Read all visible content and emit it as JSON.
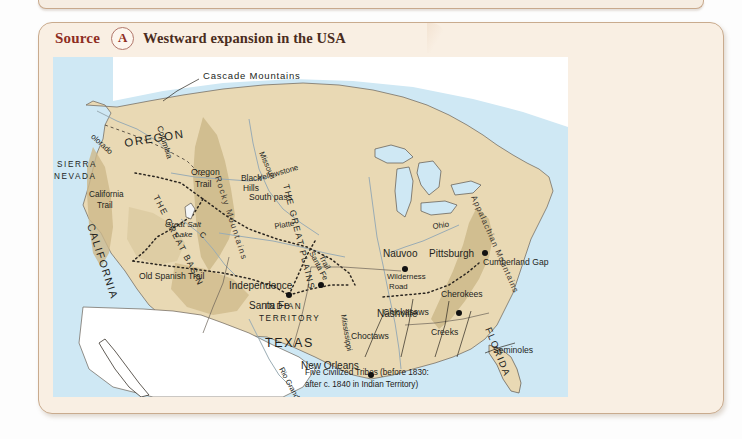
{
  "card": {
    "source_word": "Source",
    "source_letter": "A",
    "title": "Westward expansion in the USA"
  },
  "map": {
    "key_line1": "Five Civilized Tribes (before 1830:",
    "key_line2": "after c. 1840 in Indian Territory)",
    "cities": [
      {
        "name": "Nauvoo",
        "x": 352,
        "y": 212
      },
      {
        "name": "Pittsburgh",
        "x": 432,
        "y": 196
      },
      {
        "name": "Independence",
        "x": 305,
        "y": 237
      },
      {
        "name": "Nashville",
        "x": 383,
        "y": 256
      },
      {
        "name": "Santa Fe",
        "x": 232,
        "y": 268
      },
      {
        "name": "New Orleans",
        "x": 342,
        "y": 325
      }
    ],
    "regions": [
      {
        "name": "OREGON"
      },
      {
        "name": "CALIFORNIA"
      },
      {
        "name": "SIERRA NEVADA"
      },
      {
        "name": "TEXAS"
      },
      {
        "name": "FLORIDA"
      },
      {
        "name": "INDIAN TERRITORY"
      },
      {
        "name": "THE GREAT BASIN"
      },
      {
        "name": "THE GREAT PLAINS"
      }
    ],
    "physical": [
      {
        "name": "Cascade Mountains"
      },
      {
        "name": "Rocky Mountains"
      },
      {
        "name": "Appalachian Mountains"
      },
      {
        "name": "Black Hills"
      },
      {
        "name": "Great Salt Lake"
      },
      {
        "name": "South pass"
      },
      {
        "name": "Cumberland Gap"
      },
      {
        "name": "Columbia"
      },
      {
        "name": "Yellowstone"
      },
      {
        "name": "Missouri"
      },
      {
        "name": "Platte"
      },
      {
        "name": "Colorado"
      },
      {
        "name": "Ohio"
      },
      {
        "name": "Mississippi"
      },
      {
        "name": "Rio Grande"
      }
    ],
    "trails": [
      {
        "name": "Oregon Trail"
      },
      {
        "name": "California Trail"
      },
      {
        "name": "Old Spanish Trail"
      },
      {
        "name": "Santa Fe Trail"
      },
      {
        "name": "Wilderness Road"
      }
    ],
    "tribes": [
      {
        "name": "Cherokees"
      },
      {
        "name": "Chickasaws"
      },
      {
        "name": "Choctaws"
      },
      {
        "name": "Creeks"
      },
      {
        "name": "Seminoles"
      }
    ],
    "labels": {
      "cascade_mountains": "Cascade Mountains",
      "columbia": "Columbia",
      "oregon": "OREGON",
      "oregon_trail_1": "Oregon",
      "oregon_trail_2": "Trail",
      "rocky_mountains": "Rocky Mountains",
      "yellowstone": "Yellowstone",
      "missouri": "Missouri",
      "black_hills_1": "Black",
      "black_hills_2": "Hills",
      "sierra_1": "SIERRA",
      "sierra_2": "NEVADA",
      "california_trail_1": "California",
      "california_trail_2": "Trail",
      "great_basin": "THE GREAT BASIN",
      "great_salt_lake_1": "Great Salt",
      "great_salt_lake_2": "Lake",
      "south_pass": "South pass",
      "great_plains": "THE GREAT PLAINS",
      "platte": "Platte",
      "colorado": "Colorado",
      "california": "CALIFORNIA",
      "old_spanish_trail": "Old Spanish Trail",
      "santa_fe_trail_1": "Santa Fe",
      "santa_fe_trail_2": "Trail",
      "santa_fe": "Santa Fe",
      "nauvoo": "Nauvoo",
      "independence": "Independence",
      "pittsburgh": "Pittsburgh",
      "ohio": "Ohio",
      "appalachian": "Appalachian Mountains",
      "wilderness_road_1": "Wilderness",
      "wilderness_road_2": "Road",
      "cumberland_gap": "Cumberland Gap",
      "nashville": "Nashville",
      "cherokees": "Cherokees",
      "chickasaws": "Chickasaws",
      "choctaws": "Choctaws",
      "creeks": "Creeks",
      "seminoles": "Seminoles",
      "florida": "FLORIDA",
      "mississippi": "Mississippi",
      "indian_territory_1": "INDIAN",
      "indian_territory_2": "TERRITORY",
      "texas": "TEXAS",
      "new_orleans": "New Orleans",
      "rio_grande": "Rio Grande"
    },
    "colors": {
      "ocean": "#cfe8f4",
      "land": "#e9d9b4",
      "highland": "#cdb88a",
      "foreign": "#ffffff",
      "trail": "#2b2620",
      "river": "#9aacb4"
    }
  }
}
